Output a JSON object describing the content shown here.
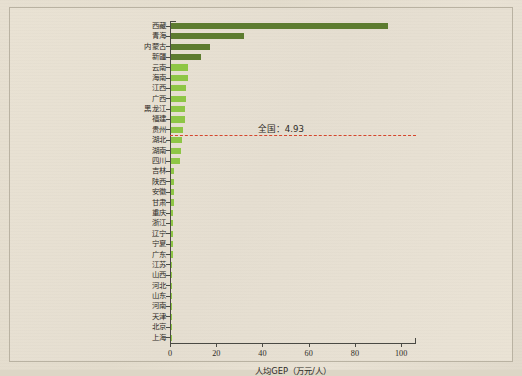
{
  "chart_data": {
    "type": "bar",
    "orientation": "horizontal",
    "title": "",
    "xlabel": "人均GEP（万元/人）",
    "ylabel": "",
    "xlim": [
      0,
      106
    ],
    "xticks": [
      0,
      20,
      40,
      60,
      80,
      100
    ],
    "grid": false,
    "legend": null,
    "categories": [
      "西藏",
      "青海",
      "内蒙古",
      "新疆",
      "云南",
      "海南",
      "江西",
      "广西",
      "黑龙江",
      "福建",
      "贵州",
      "湖北",
      "湖南",
      "四川",
      "吉林",
      "陕西",
      "安徽",
      "甘肃",
      "重庆",
      "浙江",
      "辽宁",
      "宁夏",
      "广东",
      "江苏",
      "山西",
      "河北",
      "山东",
      "河南",
      "天津",
      "北京",
      "上海"
    ],
    "values": [
      94.0,
      31.5,
      17.0,
      13.0,
      7.4,
      7.3,
      6.6,
      6.4,
      6.2,
      5.9,
      5.4,
      4.6,
      4.2,
      4.0,
      1.5,
      1.3,
      1.2,
      1.1,
      1.0,
      0.9,
      0.8,
      0.8,
      0.7,
      0.6,
      0.6,
      0.5,
      0.5,
      0.4,
      0.3,
      0.3,
      0.2
    ],
    "bar_colors": [
      "dark",
      "dark",
      "dark",
      "dark",
      "light",
      "light",
      "light",
      "light",
      "light",
      "light",
      "light",
      "light",
      "light",
      "light",
      "light",
      "light",
      "light",
      "light",
      "light",
      "light",
      "light",
      "light",
      "light",
      "light",
      "light",
      "light",
      "light",
      "light",
      "light",
      "light",
      "light"
    ],
    "colors": {
      "bar_dark": "#5d7c30",
      "bar_light": "#8ec646",
      "reference_line": "#d4462c",
      "axis": "#4a4a44",
      "background": "#e7e0d1"
    },
    "annotations": [
      {
        "name": "national-average",
        "label": "全国：4.93",
        "value": 4.93,
        "style": "dashed-horizontal",
        "between_categories": [
          "贵州",
          "湖北"
        ]
      }
    ]
  }
}
